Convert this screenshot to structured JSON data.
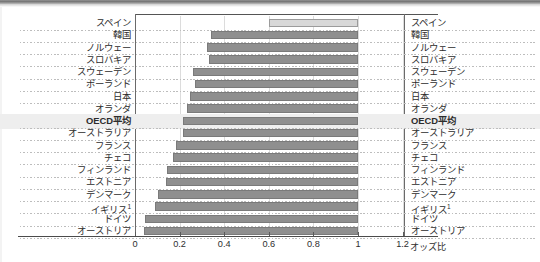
{
  "chart_data": {
    "type": "bar",
    "orientation": "horizontal",
    "title": "",
    "xlabel": "オッズ比",
    "ylabel": "",
    "xlim": [
      0,
      1.25
    ],
    "xticks": [
      "0",
      "0.2",
      "0.4",
      "0.6",
      "0.8",
      "1",
      "1.2"
    ],
    "xtick_values": [
      0,
      0.2,
      0.4,
      0.6,
      0.8,
      1.0,
      1.2
    ],
    "grid": true,
    "reference_value": 1.0,
    "categories": [
      "スペイン",
      "韓国",
      "ノルウェー",
      "スロバキア",
      "スウェーデン",
      "ポーランド",
      "日本",
      "オランダ",
      "OECD平均",
      "オーストラリア",
      "フランス",
      "チェコ",
      "フィンランド",
      "エストニア",
      "デンマーク",
      "イギリス",
      "ドイツ",
      "オーストリア"
    ],
    "categories_right": [
      "スペイン",
      "韓国",
      "ノルウェー",
      "スロバキア",
      "スウェーデン",
      "ポーランド",
      "日本",
      "オランダ",
      "OECD平均",
      "オーストラリア",
      "フランス",
      "チェコ",
      "フィンランド",
      "エストニア",
      "デンマーク",
      "イギリス",
      "ドイツ",
      "オーストリア"
    ],
    "bars": [
      {
        "label": "スペイン",
        "low": 0.6,
        "high": 1.0,
        "style": "light",
        "highlight": false,
        "footnote": ""
      },
      {
        "label": "韓国",
        "low": 0.34,
        "high": 1.0,
        "style": "normal",
        "highlight": false,
        "footnote": ""
      },
      {
        "label": "ノルウェー",
        "low": 0.325,
        "high": 1.0,
        "style": "normal",
        "highlight": false,
        "footnote": ""
      },
      {
        "label": "スロバキア",
        "low": 0.33,
        "high": 1.0,
        "style": "normal",
        "highlight": false,
        "footnote": ""
      },
      {
        "label": "スウェーデン",
        "low": 0.26,
        "high": 1.0,
        "style": "normal",
        "highlight": false,
        "footnote": ""
      },
      {
        "label": "ポーランド",
        "low": 0.27,
        "high": 1.0,
        "style": "normal",
        "highlight": false,
        "footnote": ""
      },
      {
        "label": "日本",
        "low": 0.245,
        "high": 1.0,
        "style": "normal",
        "highlight": false,
        "footnote": ""
      },
      {
        "label": "オランダ",
        "low": 0.235,
        "high": 1.0,
        "style": "normal",
        "highlight": false,
        "footnote": ""
      },
      {
        "label": "OECD平均",
        "low": 0.215,
        "high": 1.0,
        "style": "normal",
        "highlight": true,
        "footnote": ""
      },
      {
        "label": "オーストラリア",
        "low": 0.215,
        "high": 1.0,
        "style": "normal",
        "highlight": false,
        "footnote": ""
      },
      {
        "label": "フランス",
        "low": 0.185,
        "high": 1.0,
        "style": "normal",
        "highlight": false,
        "footnote": ""
      },
      {
        "label": "チェコ",
        "low": 0.17,
        "high": 1.0,
        "style": "normal",
        "highlight": false,
        "footnote": ""
      },
      {
        "label": "フィンランド",
        "low": 0.145,
        "high": 1.0,
        "style": "normal",
        "highlight": false,
        "footnote": ""
      },
      {
        "label": "エストニア",
        "low": 0.14,
        "high": 1.0,
        "style": "normal",
        "highlight": false,
        "footnote": ""
      },
      {
        "label": "デンマーク",
        "low": 0.105,
        "high": 1.0,
        "style": "normal",
        "highlight": false,
        "footnote": ""
      },
      {
        "label": "イギリス",
        "low": 0.09,
        "high": 1.0,
        "style": "normal",
        "highlight": false,
        "footnote": "1"
      },
      {
        "label": "ドイツ",
        "low": 0.045,
        "high": 1.0,
        "style": "normal",
        "highlight": false,
        "footnote": ""
      },
      {
        "label": "オーストリア",
        "low": 0.04,
        "high": 1.0,
        "style": "normal",
        "highlight": false,
        "footnote": ""
      }
    ]
  }
}
